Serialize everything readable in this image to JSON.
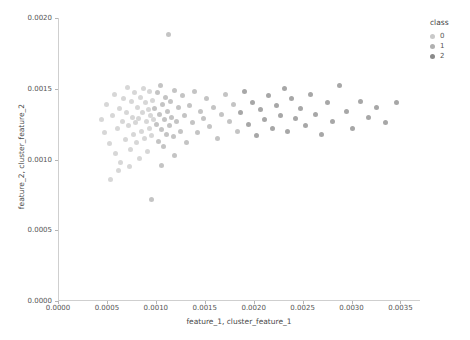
{
  "chart_data": {
    "type": "scatter",
    "title": "",
    "xlabel": "feature_1, cluster_feature_1",
    "ylabel": "feature_2, cluster_feature_2",
    "xlim": [
      0.0,
      0.0037
    ],
    "ylim": [
      0.0,
      0.002
    ],
    "xticks": [
      "0.0000",
      "0.0005",
      "0.0010",
      "0.0015",
      "0.0020",
      "0.0025",
      "0.0030",
      "0.0035"
    ],
    "xtick_values": [
      0.0,
      0.0005,
      0.001,
      0.0015,
      0.002,
      0.0025,
      0.003,
      0.0035
    ],
    "yticks": [
      "0.0000",
      "0.0005",
      "0.0010",
      "0.0015",
      "0.0020"
    ],
    "ytick_values": [
      0.0,
      0.0005,
      0.001,
      0.0015,
      0.002
    ],
    "grid": false,
    "legend": {
      "title": "class",
      "position": "top-right-outside",
      "entries": [
        {
          "label": "0",
          "color": "#c9c9c9"
        },
        {
          "label": "1",
          "color": "#b0b0b0"
        },
        {
          "label": "2",
          "color": "#8a8a8a"
        }
      ]
    },
    "series": [
      {
        "name": "0",
        "color": "#c9c9c9",
        "points": [
          [
            0.00043,
            0.00128
          ],
          [
            0.00046,
            0.00119
          ],
          [
            0.00049,
            0.00139
          ],
          [
            0.00052,
            0.00111
          ],
          [
            0.00055,
            0.00131
          ],
          [
            0.00057,
            0.00146
          ],
          [
            0.00058,
            0.00104
          ],
          [
            0.0006,
            0.00122
          ],
          [
            0.00062,
            0.00136
          ],
          [
            0.00063,
            0.00098
          ],
          [
            0.00065,
            0.00127
          ],
          [
            0.00066,
            0.00143
          ],
          [
            0.00068,
            0.00114
          ],
          [
            0.00069,
            0.00133
          ],
          [
            0.0007,
            0.00151
          ],
          [
            0.00071,
            0.00124
          ],
          [
            0.00073,
            0.00107
          ],
          [
            0.00074,
            0.00141
          ],
          [
            0.00075,
            0.0013
          ],
          [
            0.00076,
            0.00118
          ],
          [
            0.00077,
            0.00147
          ],
          [
            0.00078,
            0.00126
          ],
          [
            0.00079,
            0.00112
          ],
          [
            0.0008,
            0.00137
          ],
          [
            0.00081,
            0.00129
          ],
          [
            0.00083,
            0.00144
          ],
          [
            0.00084,
            0.0012
          ],
          [
            0.00085,
            0.00133
          ],
          [
            0.00086,
            0.0015
          ],
          [
            0.00087,
            0.00115
          ],
          [
            0.00088,
            0.0014
          ],
          [
            0.00089,
            0.00127
          ],
          [
            0.0009,
            0.00106
          ],
          [
            0.00091,
            0.00135
          ],
          [
            0.00092,
            0.00148
          ],
          [
            0.00093,
            0.00122
          ],
          [
            0.00094,
            0.00131
          ],
          [
            0.00095,
            0.00117
          ],
          [
            0.00096,
            0.00142
          ],
          [
            0.00097,
            0.00128
          ],
          [
            0.00053,
            0.00086
          ],
          [
            0.00061,
            0.00092
          ],
          [
            0.00072,
            0.00095
          ],
          [
            0.00082,
            0.00101
          ]
        ]
      },
      {
        "name": "1",
        "color": "#b0b0b0",
        "points": [
          [
            0.00098,
            0.00136
          ],
          [
            0.001,
            0.00125
          ],
          [
            0.00101,
            0.00147
          ],
          [
            0.00102,
            0.00113
          ],
          [
            0.00103,
            0.00132
          ],
          [
            0.00104,
            0.00152
          ],
          [
            0.00105,
            0.00121
          ],
          [
            0.00106,
            0.00139
          ],
          [
            0.00107,
            0.00109
          ],
          [
            0.00108,
            0.00128
          ],
          [
            0.00109,
            0.00144
          ],
          [
            0.0011,
            0.00118
          ],
          [
            0.00111,
            0.00134
          ],
          [
            0.00112,
            0.00188
          ],
          [
            0.00113,
            0.00124
          ],
          [
            0.00114,
            0.00141
          ],
          [
            0.00115,
            0.0013
          ],
          [
            0.00117,
            0.00116
          ],
          [
            0.00118,
            0.00149
          ],
          [
            0.0012,
            0.00127
          ],
          [
            0.00122,
            0.00137
          ],
          [
            0.00124,
            0.0012
          ],
          [
            0.00126,
            0.00145
          ],
          [
            0.00128,
            0.00131
          ],
          [
            0.0013,
            0.00112
          ],
          [
            0.00133,
            0.00138
          ],
          [
            0.00136,
            0.00126
          ],
          [
            0.00139,
            0.00148
          ],
          [
            0.00142,
            0.00119
          ],
          [
            0.00145,
            0.00134
          ],
          [
            0.00148,
            0.00129
          ],
          [
            0.00151,
            0.00143
          ],
          [
            0.00154,
            0.00123
          ],
          [
            0.00158,
            0.00137
          ],
          [
            0.00162,
            0.00115
          ],
          [
            0.00166,
            0.00132
          ],
          [
            0.0017,
            0.00146
          ],
          [
            0.00174,
            0.00127
          ],
          [
            0.00178,
            0.00139
          ],
          [
            0.00182,
            0.0012
          ],
          [
            0.00095,
            0.00072
          ],
          [
            0.00105,
            0.00096
          ],
          [
            0.00118,
            0.00103
          ]
        ]
      },
      {
        "name": "2",
        "color": "#8a8a8a",
        "points": [
          [
            0.00186,
            0.00133
          ],
          [
            0.0019,
            0.00148
          ],
          [
            0.00194,
            0.00125
          ],
          [
            0.00198,
            0.0014
          ],
          [
            0.00202,
            0.00117
          ],
          [
            0.00206,
            0.00135
          ],
          [
            0.0021,
            0.00128
          ],
          [
            0.00214,
            0.00145
          ],
          [
            0.00218,
            0.00122
          ],
          [
            0.00222,
            0.00138
          ],
          [
            0.00226,
            0.00131
          ],
          [
            0.0023,
            0.0015
          ],
          [
            0.00234,
            0.0012
          ],
          [
            0.00238,
            0.00143
          ],
          [
            0.00242,
            0.00129
          ],
          [
            0.00247,
            0.00136
          ],
          [
            0.00252,
            0.00124
          ],
          [
            0.00257,
            0.00146
          ],
          [
            0.00262,
            0.00132
          ],
          [
            0.00268,
            0.00118
          ],
          [
            0.00274,
            0.0014
          ],
          [
            0.0028,
            0.00127
          ],
          [
            0.00287,
            0.00152
          ],
          [
            0.00294,
            0.00134
          ],
          [
            0.003,
            0.00122
          ],
          [
            0.00308,
            0.00141
          ],
          [
            0.00316,
            0.0013
          ],
          [
            0.00325,
            0.00137
          ],
          [
            0.00334,
            0.00126
          ],
          [
            0.00345,
            0.0014
          ]
        ]
      }
    ]
  }
}
